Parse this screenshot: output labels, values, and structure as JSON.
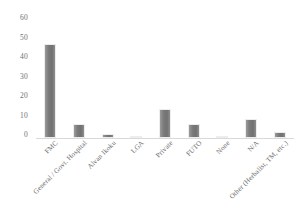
{
  "chart_data": {
    "type": "bar",
    "title": "",
    "subtitle": "",
    "xlabel": "",
    "ylabel": "",
    "ylim": [
      0,
      60
    ],
    "yticks": [
      0,
      10,
      20,
      30,
      40,
      50,
      60
    ],
    "grid": false,
    "legend": false,
    "legend_position": "none",
    "bar_color": "#7b7b7b",
    "axis_color": "#d9d9d9",
    "tick_label_color": "#6b6b6b",
    "categories": [
      "FMC",
      "General / Govt. Hospital",
      "Alvan Ikoku",
      "LGA",
      "Private",
      "FUTO",
      "None",
      "N/A",
      "Other (Herbalist, TM, etc.)"
    ],
    "values": [
      48,
      7,
      2,
      1,
      15,
      7,
      1,
      10,
      3
    ],
    "series": [
      {
        "name": "",
        "values": [
          48,
          7,
          2,
          1,
          15,
          7,
          1,
          10,
          3
        ]
      }
    ]
  }
}
